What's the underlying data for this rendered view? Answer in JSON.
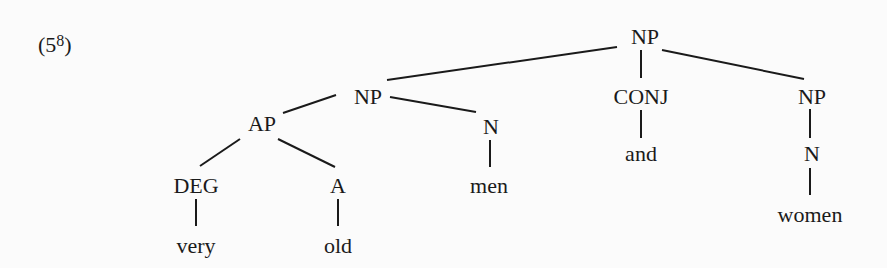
{
  "example": {
    "number_open": "(5",
    "number_sup": "8",
    "number_close": ")"
  },
  "tree": {
    "nodes": [
      {
        "id": "np-root",
        "label": "NP",
        "x": 645,
        "y": 26
      },
      {
        "id": "np-left",
        "label": "NP",
        "x": 368,
        "y": 86
      },
      {
        "id": "conj",
        "label": "CONJ",
        "x": 641,
        "y": 86
      },
      {
        "id": "np-right",
        "label": "NP",
        "x": 812,
        "y": 86
      },
      {
        "id": "ap",
        "label": "AP",
        "x": 262,
        "y": 113
      },
      {
        "id": "n-men",
        "label": "N",
        "x": 491,
        "y": 116
      },
      {
        "id": "and",
        "label": "and",
        "x": 641,
        "y": 143
      },
      {
        "id": "n-women",
        "label": "N",
        "x": 812,
        "y": 143
      },
      {
        "id": "deg",
        "label": "DEG",
        "x": 196,
        "y": 175
      },
      {
        "id": "a",
        "label": "A",
        "x": 338,
        "y": 175
      },
      {
        "id": "men",
        "label": "men",
        "x": 489,
        "y": 175
      },
      {
        "id": "women",
        "label": "women",
        "x": 810,
        "y": 204
      },
      {
        "id": "very",
        "label": "very",
        "x": 196,
        "y": 235
      },
      {
        "id": "old",
        "label": "old",
        "x": 338,
        "y": 235
      }
    ],
    "edges": [
      {
        "from": "np-root",
        "to": "np-left",
        "x1": 617,
        "y1": 47,
        "x2": 387,
        "y2": 80
      },
      {
        "from": "np-root",
        "to": "conj",
        "x1": 641,
        "y1": 50,
        "x2": 641,
        "y2": 78
      },
      {
        "from": "np-root",
        "to": "np-right",
        "x1": 662,
        "y1": 50,
        "x2": 804,
        "y2": 79
      },
      {
        "from": "np-left",
        "to": "ap",
        "x1": 336,
        "y1": 95,
        "x2": 283,
        "y2": 113
      },
      {
        "from": "np-left",
        "to": "n-men",
        "x1": 390,
        "y1": 97,
        "x2": 476,
        "y2": 112
      },
      {
        "from": "conj",
        "to": "and",
        "x1": 641,
        "y1": 110,
        "x2": 641,
        "y2": 138
      },
      {
        "from": "np-right",
        "to": "n-women",
        "x1": 810,
        "y1": 109,
        "x2": 810,
        "y2": 138
      },
      {
        "from": "ap",
        "to": "deg",
        "x1": 240,
        "y1": 139,
        "x2": 200,
        "y2": 166
      },
      {
        "from": "ap",
        "to": "a",
        "x1": 278,
        "y1": 139,
        "x2": 335,
        "y2": 167
      },
      {
        "from": "n-men",
        "to": "men",
        "x1": 490,
        "y1": 140,
        "x2": 490,
        "y2": 167
      },
      {
        "from": "deg",
        "to": "very",
        "x1": 196,
        "y1": 199,
        "x2": 196,
        "y2": 226
      },
      {
        "from": "a",
        "to": "old",
        "x1": 338,
        "y1": 199,
        "x2": 338,
        "y2": 226
      },
      {
        "from": "n-women",
        "to": "women",
        "x1": 810,
        "y1": 168,
        "x2": 810,
        "y2": 195
      }
    ]
  }
}
